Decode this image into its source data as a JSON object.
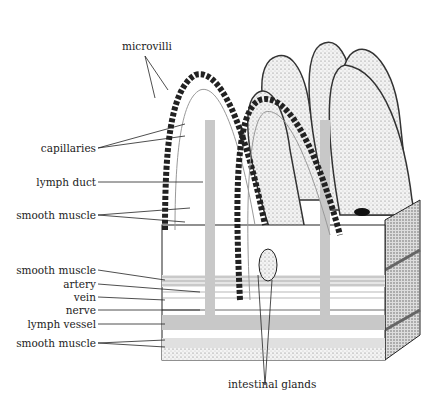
{
  "diagram": {
    "labels": {
      "microvilli": "microvilli",
      "capillaries": "capillaries",
      "lymph_duct": "lymph duct",
      "smooth_muscle_villus": "smooth muscle",
      "smooth_muscle_upper": "smooth muscle",
      "artery": "artery",
      "vein": "vein",
      "nerve": "nerve",
      "lymph_vessel": "lymph vessel",
      "smooth_muscle_lower": "smooth muscle",
      "intestinal_glands": "intestinal glands"
    },
    "colors": {
      "ink": "#222222",
      "vessel_gray": "#c8c8c8",
      "background": "#ffffff"
    }
  }
}
